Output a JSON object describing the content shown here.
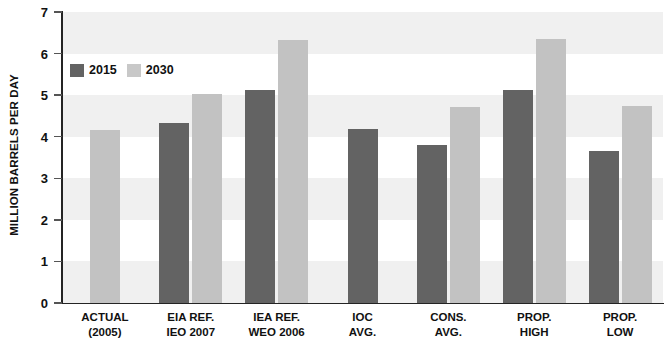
{
  "chart_data": {
    "type": "bar",
    "title": "",
    "xlabel": "",
    "ylabel": "MILLION BARRELS PER DAY",
    "ylim": [
      0,
      7
    ],
    "ytick_labels": [
      "0",
      "1",
      "2",
      "3",
      "4",
      "5",
      "6",
      "7"
    ],
    "yticks": [
      0,
      1,
      2,
      3,
      4,
      5,
      6,
      7
    ],
    "grid": false,
    "banded_background": true,
    "legend_position": "top-left-inside",
    "categories": [
      "ACTUAL\n(2005)",
      "EIA REF.\nIEO 2007",
      "IEA REF.\nWEO 2006",
      "IOC\nAVG.",
      "CONS.\nAVG.",
      "PROP.\nHIGH",
      "PROP.\nLOW"
    ],
    "category_lines": [
      [
        "ACTUAL",
        "(2005)"
      ],
      [
        "EIA REF.",
        "IEO 2007"
      ],
      [
        "IEA REF.",
        "WEO 2006"
      ],
      [
        "IOC",
        "AVG."
      ],
      [
        "CONS.",
        "AVG."
      ],
      [
        "PROP.",
        "HIGH"
      ],
      [
        "PROP.",
        "LOW"
      ]
    ],
    "series": [
      {
        "name": "2015",
        "color": "#636363",
        "values": [
          null,
          4.33,
          5.12,
          4.18,
          3.8,
          5.12,
          3.65
        ]
      },
      {
        "name": "2030",
        "color": "#c2c2c2",
        "values": [
          4.17,
          5.02,
          6.33,
          null,
          4.72,
          6.36,
          4.73
        ]
      }
    ]
  },
  "legend": {
    "items": [
      {
        "label": "2015",
        "color": "#636363"
      },
      {
        "label": "2030",
        "color": "#c8c8c8"
      }
    ]
  },
  "axis": {
    "y_title": "MILLION BARRELS PER DAY"
  },
  "colors": {
    "bar_2015": "#636363",
    "bar_2030": "#c2c2c2",
    "band_shaded": "#f0f0f0",
    "band_plain": "#ffffff",
    "axis": "#242424"
  }
}
